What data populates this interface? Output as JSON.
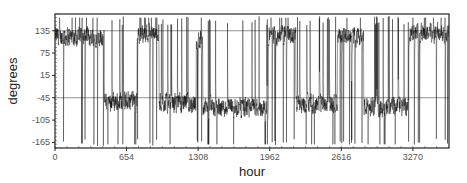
{
  "chart_data": {
    "type": "line",
    "title": "",
    "xlabel": "hour",
    "ylabel": "degrees",
    "xlim": [
      0,
      3600
    ],
    "ylim": [
      -180,
      180
    ],
    "x_ticks": [
      0,
      654,
      1308,
      1962,
      2616,
      3270
    ],
    "x_tick_labels": [
      "0",
      "654",
      "1308",
      "1962",
      "2616",
      "3270"
    ],
    "y_ticks": [
      135,
      75,
      15,
      -45,
      -105,
      -165
    ],
    "y_tick_labels": [
      "135",
      "75",
      "15",
      "-45",
      "-105",
      "-165"
    ],
    "gridlines_y": [
      135,
      -45
    ],
    "grid": true,
    "legend": null,
    "series": [
      {
        "name": "degrees",
        "color": "#000000",
        "description": "Dense hourly angle time series oscillating between about -180 and 180 degrees. High regimes near 100 to 170 degrees at roughly hours 0-450, 750-950, 1300-1350, 2000-2200, 2600-2800, 3250-3600; lower regimes near -100 to 0 degrees in between, with frequent full-range spikes.",
        "regimes": [
          {
            "x_start": 0,
            "x_end": 450,
            "level": 120
          },
          {
            "x_start": 450,
            "x_end": 750,
            "level": -55
          },
          {
            "x_start": 750,
            "x_end": 950,
            "level": 130
          },
          {
            "x_start": 950,
            "x_end": 1290,
            "level": -60
          },
          {
            "x_start": 1290,
            "x_end": 1350,
            "level": 110
          },
          {
            "x_start": 1350,
            "x_end": 1950,
            "level": -70
          },
          {
            "x_start": 1950,
            "x_end": 2200,
            "level": 125
          },
          {
            "x_start": 2200,
            "x_end": 2580,
            "level": -60
          },
          {
            "x_start": 2580,
            "x_end": 2820,
            "level": 120
          },
          {
            "x_start": 2820,
            "x_end": 3230,
            "level": -70
          },
          {
            "x_start": 3230,
            "x_end": 3600,
            "level": 130
          }
        ]
      }
    ]
  }
}
